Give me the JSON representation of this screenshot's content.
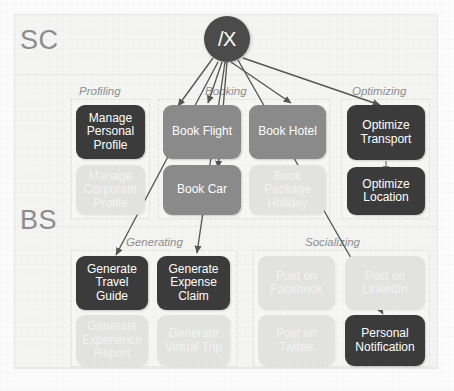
{
  "diagram": {
    "hub": {
      "label": "/X"
    },
    "bands": [
      {
        "id": "sc",
        "label": "SC"
      },
      {
        "id": "bs",
        "label": "BS"
      }
    ],
    "groups": [
      {
        "id": "profiling",
        "label": "Profiling"
      },
      {
        "id": "booking",
        "label": "Booking"
      },
      {
        "id": "optimizing",
        "label": "Optimizing"
      },
      {
        "id": "generating",
        "label": "Generating"
      },
      {
        "id": "socializing",
        "label": "Socializing"
      }
    ],
    "nodes": [
      {
        "id": "manage-personal-profile",
        "label": "Manage Personal Profile",
        "state": "dark",
        "group": "profiling"
      },
      {
        "id": "manage-corporate-profile",
        "label": "Manage Corporate Profile",
        "state": "faded",
        "group": "profiling"
      },
      {
        "id": "book-flight",
        "label": "Book Flight",
        "state": "medium",
        "group": "booking"
      },
      {
        "id": "book-hotel",
        "label": "Book Hotel",
        "state": "medium",
        "group": "booking"
      },
      {
        "id": "book-car",
        "label": "Book Car",
        "state": "medium",
        "group": "booking"
      },
      {
        "id": "book-package-holiday",
        "label": "Book Package Holiday",
        "state": "faded",
        "group": "booking"
      },
      {
        "id": "optimize-transport",
        "label": "Optimize Transport",
        "state": "dark",
        "group": "optimizing"
      },
      {
        "id": "optimize-location",
        "label": "Optimize Location",
        "state": "dark",
        "group": "optimizing"
      },
      {
        "id": "generate-travel-guide",
        "label": "Generate Travel Guide",
        "state": "dark",
        "group": "generating"
      },
      {
        "id": "generate-expense-claim",
        "label": "Generate Expense Claim",
        "state": "dark",
        "group": "generating"
      },
      {
        "id": "generate-experience-report",
        "label": "Generate Experience Report",
        "state": "faded",
        "group": "generating"
      },
      {
        "id": "generate-virtual-trip",
        "label": "Generate Virtual Trip",
        "state": "faded",
        "group": "generating"
      },
      {
        "id": "post-on-facebook",
        "label": "Post on Facebook",
        "state": "faded",
        "group": "socializing"
      },
      {
        "id": "post-on-linkedin",
        "label": "Post on LinkedIn",
        "state": "faded",
        "group": "socializing"
      },
      {
        "id": "post-on-twitter",
        "label": "Post on Twitter",
        "state": "faded",
        "group": "socializing"
      },
      {
        "id": "personal-notification",
        "label": "Personal Notification",
        "state": "dark",
        "group": "socializing"
      }
    ],
    "edges": [
      {
        "from": "hub",
        "to": "manage-personal-profile"
      },
      {
        "from": "hub",
        "to": "book-flight"
      },
      {
        "from": "hub",
        "to": "book-hotel"
      },
      {
        "from": "hub",
        "to": "book-car"
      },
      {
        "from": "hub",
        "to": "optimize-transport"
      },
      {
        "from": "hub",
        "to": "generate-travel-guide"
      },
      {
        "from": "hub",
        "to": "generate-expense-claim"
      },
      {
        "from": "hub",
        "to": "personal-notification"
      },
      {
        "from": "optimize-transport",
        "to": "optimize-location"
      }
    ],
    "colors": {
      "dark": "#3b3b3b",
      "medium": "#8a8a8a",
      "faded": "#e2e2e0",
      "hub": "#4b4b4b",
      "label": "#8e8e8e",
      "band": "#8c8c8c",
      "edge": "#555555",
      "background": "#f4f4f3"
    }
  }
}
